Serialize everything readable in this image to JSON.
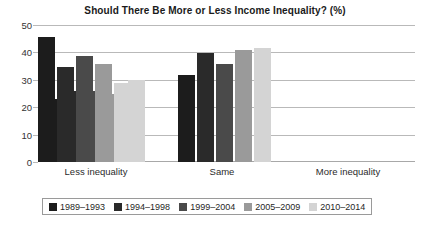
{
  "chart_data": {
    "type": "bar",
    "title": "Should There Be More or Less Income Inequality? (%)",
    "xlabel": "",
    "ylabel": "",
    "ylim": [
      0,
      50
    ],
    "yticks": [
      0,
      10,
      20,
      30,
      40,
      50
    ],
    "grid": true,
    "legend_position": "bottom",
    "categories": [
      "Less inequality",
      "Same",
      "More inequality"
    ],
    "series": [
      {
        "name": "1989–1993",
        "color": "#1c1c1c",
        "values": [
          23,
          32,
          46
        ]
      },
      {
        "name": "1994–1998",
        "color": "#2a2a2a",
        "values": [
          26,
          40,
          35
        ]
      },
      {
        "name": "1999–2004",
        "color": "#4a4a4a",
        "values": [
          26,
          36,
          39
        ]
      },
      {
        "name": "2005–2009",
        "color": "#9a9a9a",
        "values": [
          25,
          41,
          36
        ]
      },
      {
        "name": "2010–2014",
        "color": "#d4d4d4",
        "values": [
          30,
          42,
          29
        ]
      }
    ]
  },
  "axis": {
    "tick_0": "0",
    "tick_10": "10",
    "tick_20": "20",
    "tick_30": "30",
    "tick_40": "40",
    "tick_50": "50"
  },
  "categories": {
    "less": "Less inequality",
    "same": "Same",
    "more": "More inequality"
  },
  "legend": {
    "item_1": "1989–1993",
    "item_2": "1994–1998",
    "item_3": "1999–2004",
    "item_4": "2005–2009",
    "item_5": "2010–2014"
  },
  "title": "Should There Be More or Less Income Inequality? (%)"
}
